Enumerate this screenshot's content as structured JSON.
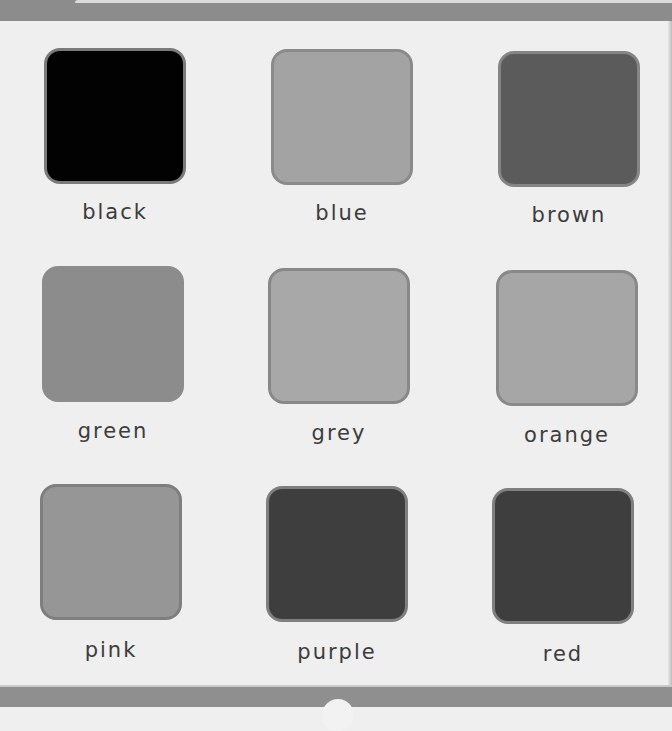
{
  "page": {
    "background": "#efefef",
    "band_color": "#8c8c8c"
  },
  "swatches": [
    {
      "label": "black",
      "fill": "#020202",
      "border": "#7a7a7a",
      "x": 44,
      "y": 48,
      "label_x": 15,
      "label_y": 200
    },
    {
      "label": "blue",
      "fill": "#a3a3a3",
      "border": "#8a8a8a",
      "x": 271,
      "y": 49,
      "label_x": 242,
      "label_y": 201
    },
    {
      "label": "brown",
      "fill": "#5b5b5b",
      "border": "#858585",
      "x": 498,
      "y": 51,
      "label_x": 469,
      "label_y": 203
    },
    {
      "label": "green",
      "fill": "#8c8c8c",
      "border": "#8c8c8c",
      "x": 42,
      "y": 266,
      "label_x": 13,
      "label_y": 419
    },
    {
      "label": "grey",
      "fill": "#a8a8a8",
      "border": "#888888",
      "x": 268,
      "y": 268,
      "label_x": 239,
      "label_y": 421
    },
    {
      "label": "orange",
      "fill": "#a6a6a6",
      "border": "#898989",
      "x": 496,
      "y": 270,
      "label_x": 467,
      "label_y": 423
    },
    {
      "label": "pink",
      "fill": "#969696",
      "border": "#7e7e7e",
      "x": 40,
      "y": 484,
      "label_x": 11,
      "label_y": 638
    },
    {
      "label": "purple",
      "fill": "#3e3e3e",
      "border": "#7f7f7f",
      "x": 266,
      "y": 486,
      "label_x": 237,
      "label_y": 640
    },
    {
      "label": "red",
      "fill": "#3e3e3e",
      "border": "#7f7f7f",
      "x": 492,
      "y": 488,
      "label_x": 463,
      "label_y": 642
    }
  ]
}
